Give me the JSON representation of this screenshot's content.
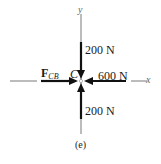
{
  "diagram": {
    "type": "free-body-diagram",
    "point": "C",
    "axes": {
      "x_label": "x",
      "y_label": "y"
    },
    "forces": [
      {
        "name": "F",
        "subscript": "CB",
        "direction": "right, toward C",
        "magnitude_label": "F_CB"
      },
      {
        "name": "top",
        "direction": "down, toward C",
        "magnitude_label": "200 N"
      },
      {
        "name": "right",
        "direction": "left, toward C",
        "magnitude_label": "600 N"
      },
      {
        "name": "bottom",
        "direction": "up, toward C",
        "magnitude_label": "200 N"
      }
    ],
    "caption": "(e)"
  },
  "labels": {
    "y_axis": "y",
    "x_axis": "x",
    "point": "C",
    "f_main": "F",
    "f_sub": "CB",
    "top_force": "200 N",
    "right_force": "600 N",
    "bottom_force": "200 N",
    "caption": "(e)"
  }
}
